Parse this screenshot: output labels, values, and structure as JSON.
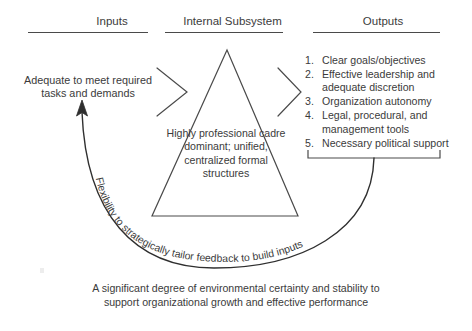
{
  "diagram": {
    "title_columns": {
      "inputs": "Inputs",
      "internal": "Internal Subsystem",
      "outputs": "Outputs"
    },
    "inputs": {
      "text": "Adequate to meet required tasks and demands"
    },
    "internal_subsystem": {
      "shape": "triangle",
      "text": "Highly professional cadre dominant; unified, centralized formal structures"
    },
    "outputs": {
      "items": [
        {
          "number": "1.",
          "label": "Clear goals/objectives"
        },
        {
          "number": "2.",
          "label": "Effective leadership and adequate discretion"
        },
        {
          "number": "3.",
          "label": "Organization autonomy"
        },
        {
          "number": "4.",
          "label": "Legal, procedural, and management tools"
        },
        {
          "number": "5.",
          "label": "Necessary political support"
        }
      ]
    },
    "feedback_arc": {
      "label": "Flexibility to strategically tailor feedback to build inputs"
    },
    "bottom_caption": {
      "text": "A significant degree of environmental certainty and stability to support organizational growth and effective performance"
    },
    "colors": {
      "ink": "#3b3b3b",
      "line": "#4a4a4a",
      "background": "#ffffff"
    }
  }
}
